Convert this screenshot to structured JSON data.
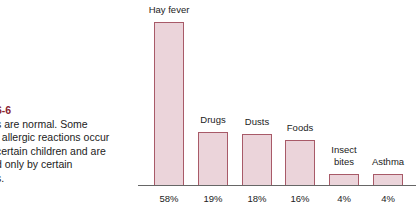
{
  "caption": {
    "figure_label": "6-6",
    "lines": [
      "s are normal. Some",
      "f allergic reactions occur",
      "certain children and are",
      "d only by certain",
      "s."
    ]
  },
  "colors": {
    "bar_fill": "#ebd4da",
    "bar_border": "#a85a68",
    "figure_label": "#8a2430",
    "axis": "#666666"
  },
  "chart_data": {
    "type": "bar",
    "title": "",
    "xlabel": "",
    "ylabel": "",
    "categories": [
      "Hay fever",
      "Drugs",
      "Dusts",
      "Foods",
      "Insect bites",
      "Asthma"
    ],
    "values": [
      58,
      19,
      18,
      16,
      4,
      4
    ],
    "value_labels": [
      "58%",
      "19%",
      "18%",
      "16%",
      "4%",
      "4%"
    ],
    "unit": "%",
    "ylim": [
      0,
      58
    ],
    "grid": false,
    "legend": "none"
  }
}
